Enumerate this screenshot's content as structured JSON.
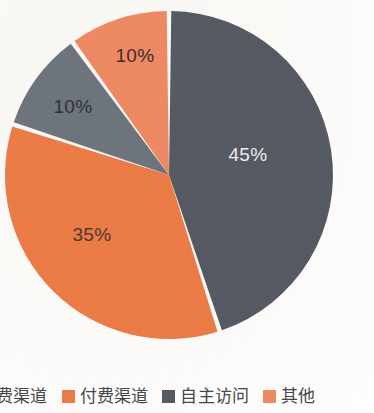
{
  "chart_data": {
    "type": "pie",
    "title": "",
    "subtitle": "",
    "xlabel": "",
    "ylabel": "",
    "legend_position": "bottom",
    "grid": false,
    "categories": [
      "免费渠道",
      "付费渠道",
      "自主访问",
      "其他"
    ],
    "values": [
      35,
      10,
      45,
      10
    ],
    "slices": [
      {
        "name": "自主访问",
        "value": 45,
        "label": "45%",
        "color": "#555a63",
        "label_color": "#efefef",
        "start_angle": 0,
        "end_angle": 162,
        "label_x": 248,
        "label_y": 155
      },
      {
        "name": "付费渠道",
        "value": 35,
        "label": "35%",
        "color": "#ed7c47",
        "label_color": "#4a3a30",
        "start_angle": 162,
        "end_angle": 288,
        "label_x": 92,
        "label_y": 235
      },
      {
        "name": "免费渠道",
        "value": 10,
        "label": "10%",
        "color": "#6f757d",
        "label_color": "#2e3238",
        "start_angle": 288,
        "end_angle": 324,
        "label_x": 73,
        "label_y": 107
      },
      {
        "name": "其他",
        "value": 10,
        "label": "10%",
        "color": "#ef8a63",
        "label_color": "#3c3028",
        "start_angle": 324,
        "end_angle": 360,
        "label_x": 135,
        "label_y": 56
      }
    ],
    "geometry": {
      "center_x": 169,
      "center_y": 175,
      "radius": 164,
      "gap_degrees": 1.6
    }
  },
  "legend": {
    "items": [
      {
        "label": "费渠道",
        "color": "#ed7c47",
        "swatch_visible": false
      },
      {
        "label": "付费渠道",
        "color": "#ed7c47",
        "swatch_visible": true
      },
      {
        "label": "自主访问",
        "color": "#555a63",
        "swatch_visible": true
      },
      {
        "label": "其他",
        "color": "#ef8a63",
        "swatch_visible": true
      }
    ]
  }
}
